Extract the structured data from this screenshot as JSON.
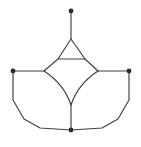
{
  "figure": {
    "background_color": "#ffffff",
    "edge_color": "#404040",
    "vertex_color": "#2b2b2b",
    "edge_width": 1.15,
    "vertex_radius": 2.4,
    "canvas": {
      "width": 141,
      "height": 147
    }
  },
  "chart_data": {
    "type": "diagram",
    "vertices": [
      {
        "id": "top",
        "label": "",
        "x": 71,
        "y": 11,
        "marked": true
      },
      {
        "id": "left",
        "label": "",
        "x": 13,
        "y": 71,
        "marked": true
      },
      {
        "id": "right",
        "label": "",
        "x": 129,
        "y": 71,
        "marked": true
      },
      {
        "id": "bottom",
        "label": "",
        "x": 71,
        "y": 130,
        "marked": true
      },
      {
        "id": "tri-apex",
        "label": "",
        "x": 71,
        "y": 39,
        "marked": false
      },
      {
        "id": "tri-base-left",
        "label": "",
        "x": 58,
        "y": 59,
        "marked": false
      },
      {
        "id": "tri-base-right",
        "label": "",
        "x": 85,
        "y": 59,
        "marked": false
      },
      {
        "id": "junction-left",
        "label": "",
        "x": 44,
        "y": 71,
        "marked": false
      },
      {
        "id": "junction-right",
        "label": "",
        "x": 98,
        "y": 71,
        "marked": false
      },
      {
        "id": "star-bottom",
        "label": "",
        "x": 71,
        "y": 105,
        "marked": false
      }
    ],
    "edges": [
      {
        "id": "pendant",
        "from": "top",
        "to": "tri-apex",
        "shape": "line"
      },
      {
        "id": "tri-left-side",
        "from": "tri-apex",
        "to": "tri-base-left",
        "shape": "line"
      },
      {
        "id": "tri-right-side",
        "from": "tri-apex",
        "to": "tri-base-right",
        "shape": "line"
      },
      {
        "id": "tri-base",
        "from": "tri-base-left",
        "to": "tri-base-right",
        "shape": "line"
      },
      {
        "id": "left-spoke",
        "from": "left",
        "to": "junction-left",
        "shape": "line"
      },
      {
        "id": "right-spoke",
        "from": "right",
        "to": "junction-right",
        "shape": "line"
      },
      {
        "id": "junction-left-to-triangle",
        "from": "junction-left",
        "to": "tri-base-left",
        "shape": "line"
      },
      {
        "id": "junction-right-to-triangle",
        "from": "junction-right",
        "to": "tri-base-right",
        "shape": "line"
      },
      {
        "id": "star-lower-left",
        "from": "junction-left",
        "to": "star-bottom",
        "shape": "concave-curve"
      },
      {
        "id": "star-lower-right",
        "from": "junction-right",
        "to": "star-bottom",
        "shape": "concave-curve"
      },
      {
        "id": "star-stem",
        "from": "star-bottom",
        "to": "bottom",
        "shape": "line"
      },
      {
        "id": "outer-left",
        "from": "left",
        "to": "bottom",
        "shape": "polyline"
      },
      {
        "id": "outer-right",
        "from": "right",
        "to": "bottom",
        "shape": "polyline"
      }
    ],
    "marked_vertex_count": 4,
    "faces": [
      "triangle",
      "star",
      "outer-polygon"
    ]
  }
}
